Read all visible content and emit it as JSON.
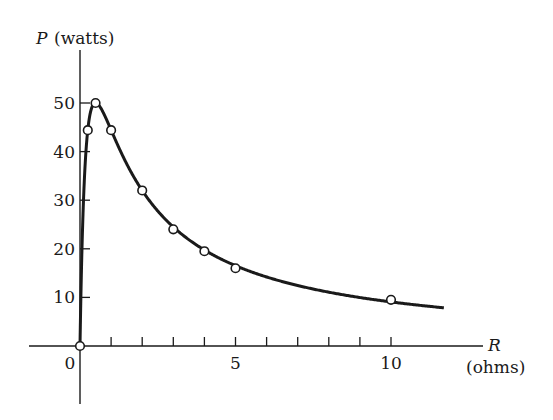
{
  "chart_data": {
    "type": "line",
    "title": "",
    "ylabel_var": "P",
    "ylabel_unit": "(watts)",
    "xlabel_var": "R",
    "xlabel_unit": "(ohms)",
    "x_ticks": [
      1,
      2,
      3,
      4,
      5,
      6,
      7,
      8,
      9,
      10
    ],
    "x_tick_labels": [
      {
        "value": 0,
        "label": "0"
      },
      {
        "value": 5,
        "label": "5"
      },
      {
        "value": 10,
        "label": "10"
      }
    ],
    "y_ticks": [
      10,
      20,
      30,
      40,
      50
    ],
    "y_tick_labels": [
      "10",
      "20",
      "30",
      "40",
      "50"
    ],
    "xlim": [
      -1.6,
      12.8
    ],
    "ylim": [
      -12,
      61
    ],
    "grid": false,
    "legend": null,
    "series": [
      {
        "name": "P = E^2 R / (r + R)^2",
        "style": "smooth curve",
        "curve": {
          "E": 10,
          "r": 0.5,
          "R_min": 0,
          "R_max": 11.7
        }
      },
      {
        "name": "measured points",
        "style": "open circles",
        "points": [
          {
            "R": 0,
            "P": 0
          },
          {
            "R": 0.25,
            "P": 44.4
          },
          {
            "R": 0.5,
            "P": 50
          },
          {
            "R": 1,
            "P": 44.4
          },
          {
            "R": 2,
            "P": 32
          },
          {
            "R": 3,
            "P": 24
          },
          {
            "R": 4,
            "P": 19.5
          },
          {
            "R": 5,
            "P": 16
          },
          {
            "R": 10,
            "P": 9.5
          }
        ]
      }
    ]
  }
}
